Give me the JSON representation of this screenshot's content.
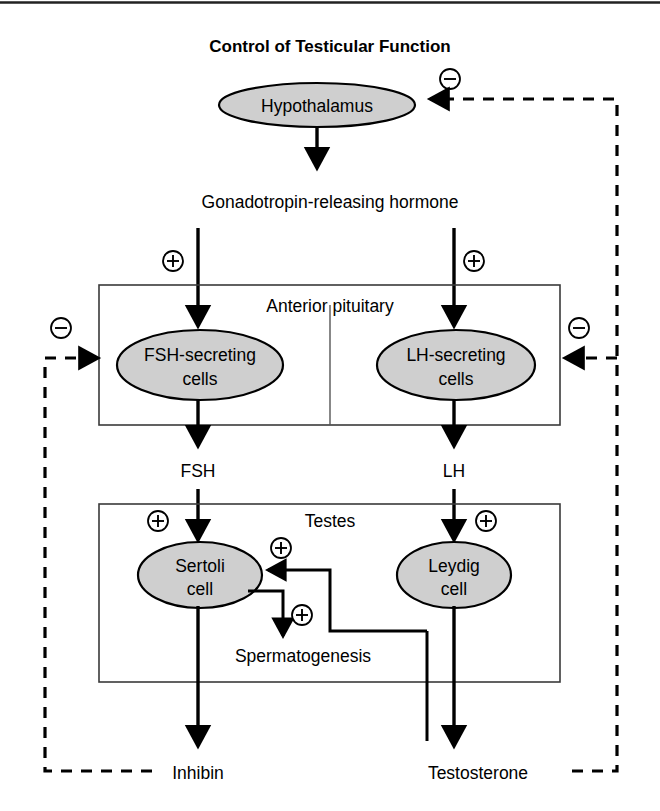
{
  "title": "Control of Testicular Function",
  "nodes": {
    "hypothalamus": "Hypothalamus",
    "fsh_cells_line1": "FSH-secreting",
    "fsh_cells_line2": "cells",
    "lh_cells_line1": "LH-secreting",
    "lh_cells_line2": "cells",
    "sertoli_line1": "Sertoli",
    "sertoli_line2": "cell",
    "leydig_line1": "Leydig",
    "leydig_line2": "cell"
  },
  "boxes": {
    "anterior_pituitary": "Anterior pituitary",
    "testes": "Testes"
  },
  "labels": {
    "gnrh": "Gonadotropin-releasing hormone",
    "fsh": "FSH",
    "lh": "LH",
    "spermatogenesis": "Spermatogenesis",
    "inhibin": "Inhibin",
    "testosterone": "Testosterone"
  },
  "signs": {
    "plus": "+",
    "minus": "-",
    "plus_name": "positive-stimulation",
    "minus_name": "negative-feedback"
  },
  "colors": {
    "node_fill": "#cfcfcf",
    "stroke": "#000000",
    "box_stroke": "#3a3a3a",
    "background": "#ffffff"
  },
  "icons": {
    "plus_icon": "plus-in-circle-icon",
    "minus_icon": "minus-in-circle-icon",
    "arrow_icon": "arrowhead-icon"
  }
}
